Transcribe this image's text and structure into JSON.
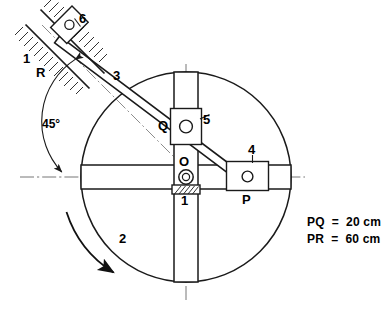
{
  "diagram": {
    "stroke_color": "#1a1a1a",
    "centerline_color": "#555555",
    "link_numbers": {
      "frame": "1",
      "frame_guide": "1",
      "rotor": "2",
      "long_link": "3",
      "slider_p": "4",
      "slider_q": "5",
      "slider_r": "6"
    },
    "point_labels": {
      "pivot": "O",
      "slider_p": "P",
      "slider_q": "Q",
      "slider_r": "R"
    },
    "angle_label": "45°",
    "dimensions": [
      "PQ  =  20 cm",
      "PR  =  60 cm"
    ],
    "dimension_lines": {
      "pq": "PQ  =  20 cm",
      "pr": "PR  =  60 cm"
    },
    "geometry": {
      "circle_center_x": 186,
      "circle_center_y": 177,
      "circle_radius": 105,
      "pivot_x": 186,
      "pivot_y": 177,
      "slider_p_x": 246,
      "slider_p_y": 177,
      "slider_q_x": 186,
      "slider_q_y": 126,
      "slider_r_x": 65,
      "slider_r_y": 42,
      "guide_angle_deg": 45
    }
  }
}
